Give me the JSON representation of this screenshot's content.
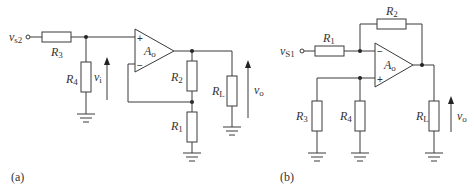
{
  "circuits": [
    {
      "caption": "(a)",
      "input": {
        "name": "v",
        "sub": "s2"
      },
      "opamp": {
        "name": "A",
        "sub": "o",
        "plus": "+",
        "minus": "−"
      },
      "resistors": {
        "R3": {
          "name": "R",
          "sub": "3"
        },
        "R4": {
          "name": "R",
          "sub": "4"
        },
        "R2": {
          "name": "R",
          "sub": "2"
        },
        "R1": {
          "name": "R",
          "sub": "1"
        },
        "RL": {
          "name": "R",
          "sub": "L"
        }
      },
      "voltages": {
        "vi": {
          "name": "v",
          "sub": "i"
        },
        "vo": {
          "name": "v",
          "sub": "o"
        }
      }
    },
    {
      "caption": "(b)",
      "input": {
        "name": "v",
        "sub": "S1"
      },
      "opamp": {
        "name": "A",
        "sub": "o",
        "plus": "+",
        "minus": "−"
      },
      "resistors": {
        "R1": {
          "name": "R",
          "sub": "1"
        },
        "R2": {
          "name": "R",
          "sub": "2"
        },
        "R3": {
          "name": "R",
          "sub": "3"
        },
        "R4": {
          "name": "R",
          "sub": "4"
        },
        "RL": {
          "name": "R",
          "sub": "L"
        }
      },
      "voltages": {
        "vo": {
          "name": "v",
          "sub": "o"
        }
      }
    }
  ]
}
